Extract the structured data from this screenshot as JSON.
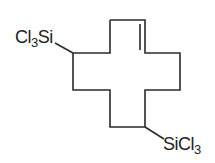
{
  "diagram": {
    "type": "chemical-structure",
    "substituents": [
      {
        "id": "top-left",
        "prefix": "Cl",
        "subscript": "3",
        "suffix": "Si"
      },
      {
        "id": "bottom-right",
        "prefix": "SiCl",
        "subscript": "3",
        "suffix": ""
      }
    ],
    "line_color": "#2a2a2a"
  }
}
